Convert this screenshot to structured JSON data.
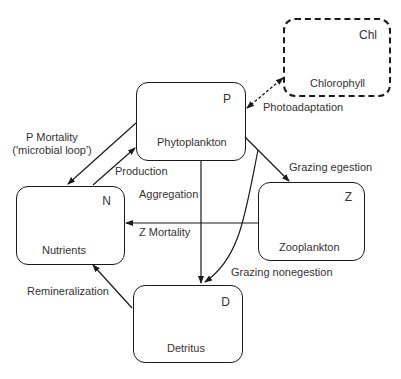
{
  "nodes": {
    "P": {
      "symbol": "P",
      "name": "Phytoplankton"
    },
    "Chl": {
      "symbol": "Chl",
      "name": "Chlorophyll"
    },
    "N": {
      "symbol": "N",
      "name": "Nutrients"
    },
    "Z": {
      "symbol": "Z",
      "name": "Zooplankton"
    },
    "D": {
      "symbol": "D",
      "name": "Detritus"
    }
  },
  "edges": {
    "p_mortality": {
      "label": "P Mortality",
      "sublabel": "('microbial loop')"
    },
    "production": {
      "label": "Production"
    },
    "photoadaptation": {
      "label": "Photoadaptation"
    },
    "grazing_egestion": {
      "label": "Grazing egestion"
    },
    "aggregation": {
      "label": "Aggregation"
    },
    "z_mortality": {
      "label": "Z Mortality"
    },
    "grazing_nonegestion": {
      "label": "Grazing nonegestion"
    },
    "remineralization": {
      "label": "Remineralization"
    }
  }
}
